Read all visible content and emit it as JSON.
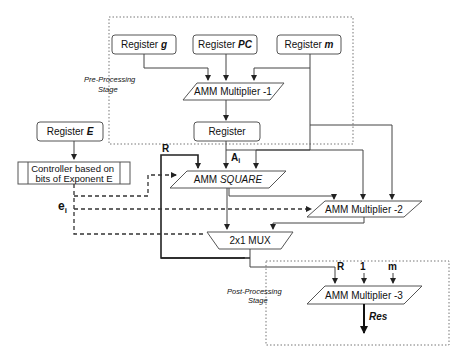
{
  "diagram": {
    "pre_stage": {
      "line1": "Pre-Processing",
      "line2": "Stage"
    },
    "post_stage": {
      "line1": "Post-Processing",
      "line2": "Stage"
    },
    "reg_g": {
      "prefix": "Register ",
      "var": "g"
    },
    "reg_pc": {
      "prefix": "Register ",
      "var": "PC"
    },
    "reg_m": {
      "prefix": "Register ",
      "var": "m"
    },
    "reg_e": {
      "prefix": "Register ",
      "var": "E"
    },
    "amm1": "AMM Multiplier -1",
    "register": "Register",
    "controller": {
      "line1": "Controller based on",
      "line2": "bits of Exponent E"
    },
    "amm_square": {
      "prefix": "AMM ",
      "italic": "SQUARE"
    },
    "amm2": "AMM Multiplier -2",
    "mux": "2x1 MUX",
    "amm3": "AMM Multiplier -3",
    "labels": {
      "R": "R",
      "Ai_main": "A",
      "Ai_sub": "i",
      "ei_main": "e",
      "ei_sub": "i",
      "post_R": "R",
      "post_1": "1",
      "post_m": "m",
      "res": "Res"
    }
  }
}
